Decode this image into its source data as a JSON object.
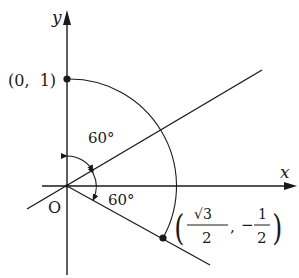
{
  "diagram": {
    "type": "unit-circle-rotation",
    "axes": {
      "x_label": "x",
      "y_label": "y",
      "origin_label": "O"
    },
    "points": {
      "top": {
        "label": "(0,  1)",
        "x": 0,
        "y": 1
      },
      "rotated": {
        "label_open": "(",
        "label_close": ")",
        "x_num": "√3",
        "x_den": "2",
        "separator": ",",
        "y_sign": "−",
        "y_num": "1",
        "y_den": "2"
      }
    },
    "angles": {
      "upper": "60°",
      "lower": "60°"
    },
    "colors": {
      "ink": "#1a1a1a",
      "background": "#ffffff"
    }
  }
}
